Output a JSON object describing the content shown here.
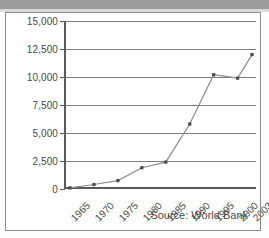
{
  "figure": {
    "source_note": "Source: World Bank"
  },
  "chart_data": {
    "type": "line",
    "title": "",
    "subtitle": "",
    "xlabel": "",
    "ylabel": "",
    "grid": true,
    "legend": false,
    "legend_position": "none",
    "categories": [
      "1965",
      "1970",
      "1975",
      "1980",
      "1985",
      "1990",
      "1995",
      "2000",
      "2003"
    ],
    "x_tick_labels": [
      "1965",
      "1970",
      "1975",
      "1980",
      "1985",
      "1990",
      "1995",
      "2000",
      "2003"
    ],
    "y_tick_labels": [
      "0",
      "2,500",
      "5,000",
      "7,500",
      "10,000",
      "12,500",
      "15,000"
    ],
    "y_tick_values": [
      0,
      2500,
      5000,
      7500,
      10000,
      12500,
      15000
    ],
    "ylim": [
      0,
      15000
    ],
    "values": [
      100,
      400,
      750,
      1900,
      2400,
      5800,
      10200,
      9900,
      12000
    ],
    "series": [
      {
        "name": "",
        "values": [
          100,
          400,
          750,
          1900,
          2400,
          5800,
          10200,
          9900,
          12000
        ],
        "color": "#8c8c8c",
        "marker": "square",
        "marker_color": "#4a4a4a"
      }
    ],
    "annotations": [
      "Source: World Bank"
    ]
  },
  "colors": {
    "line": "#8c8c8c",
    "marker": "#4a4a4a",
    "gridline": "#7d7d7d",
    "axis": "#5a5a5a",
    "text": "#4a4a4a",
    "border": "#8c8c8c",
    "top_band": "#9b9b9b",
    "background": "#ffffff"
  }
}
